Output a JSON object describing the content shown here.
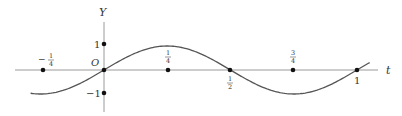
{
  "figure": {
    "type": "function-graph",
    "function": "Y = sin(2*pi*t)",
    "x_axis_label": "t",
    "y_axis_label": "Y",
    "origin_label": "O",
    "y_ticks": [
      {
        "value": 1,
        "label": "1"
      },
      {
        "value": -1,
        "label": "−1"
      }
    ],
    "x_points": [
      {
        "value": -0.25,
        "label_num": "1",
        "label_den": "4",
        "sign": "−",
        "position": "above"
      },
      {
        "value": 0.25,
        "label_num": "1",
        "label_den": "4",
        "sign": "",
        "position": "above"
      },
      {
        "value": 0.5,
        "label_num": "1",
        "label_den": "2",
        "sign": "",
        "position": "below"
      },
      {
        "value": 0.75,
        "label_num": "3",
        "label_den": "4",
        "sign": "",
        "position": "above"
      },
      {
        "value": 1,
        "label": "1",
        "position": "below"
      }
    ],
    "t_range": [
      -0.29,
      1.05
    ],
    "colors": {
      "axis": "#9a9a9a",
      "curve": "#555555",
      "dot": "#111111",
      "text": "#333333"
    }
  },
  "chart_data": {
    "type": "line",
    "title": "",
    "xlabel": "t",
    "ylabel": "Y",
    "x": [
      -0.25,
      0,
      0.25,
      0.5,
      0.75,
      1
    ],
    "series": [
      {
        "name": "Y = sin(2πt)",
        "values": [
          -1,
          0,
          1,
          0,
          -1,
          0
        ]
      }
    ],
    "marked_zeros": [
      -0.25,
      0,
      0.25,
      0.5,
      0.75,
      1
    ],
    "ylim": [
      -1,
      1
    ],
    "grid": false
  }
}
